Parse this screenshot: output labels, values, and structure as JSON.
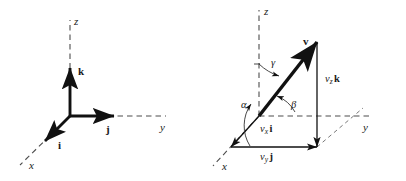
{
  "figure": {
    "background_color": "#ffffff",
    "ink_color": "#111111",
    "dashed_color": "#555555",
    "width": 406,
    "height": 181
  },
  "panels": [
    {
      "id": "unit-vectors",
      "name": "Unit vectors i, j, k on coordinate axes",
      "axes": [
        {
          "name": "x",
          "label": "x",
          "style": "dashed",
          "direction": "down-left"
        },
        {
          "name": "y",
          "label": "y",
          "style": "dashed",
          "direction": "right"
        },
        {
          "name": "z",
          "label": "z",
          "style": "dashed",
          "direction": "up"
        }
      ],
      "vectors": [
        {
          "name": "i",
          "label": "i",
          "bold": true,
          "along_axis": "x",
          "style": "solid-arrow"
        },
        {
          "name": "j",
          "label": "j",
          "bold": true,
          "along_axis": "y",
          "style": "solid-arrow"
        },
        {
          "name": "k",
          "label": "k",
          "bold": true,
          "along_axis": "z",
          "style": "solid-arrow"
        }
      ]
    },
    {
      "id": "components",
      "name": "Vector v resolved into components with direction angles alpha, beta, gamma",
      "axes": [
        {
          "name": "x",
          "label": "x",
          "style": "dashed",
          "direction": "down-left"
        },
        {
          "name": "y",
          "label": "y",
          "style": "dashed",
          "direction": "right"
        },
        {
          "name": "z",
          "label": "z",
          "style": "dashed",
          "direction": "up"
        }
      ],
      "vectors": [
        {
          "name": "v",
          "label": "v",
          "bold": true,
          "style": "thick-solid-arrow"
        }
      ],
      "components": [
        {
          "name": "vx-i",
          "scalar": "v",
          "subscript": "x",
          "unit": "i"
        },
        {
          "name": "vy-j",
          "scalar": "v",
          "subscript": "y",
          "unit": "j"
        },
        {
          "name": "vz-k",
          "scalar": "v",
          "subscript": "z",
          "unit": "k"
        }
      ],
      "angles": [
        {
          "name": "alpha",
          "label": "α",
          "between": "v and x-axis"
        },
        {
          "name": "beta",
          "label": "β",
          "between": "v and y-axis"
        },
        {
          "name": "gamma",
          "label": "γ",
          "between": "v and z-axis"
        }
      ]
    }
  ],
  "labels": {
    "left": {
      "axis_x": "x",
      "axis_y": "y",
      "axis_z": "z",
      "unit_i": "i",
      "unit_j": "j",
      "unit_k": "k"
    },
    "right": {
      "axis_x": "x",
      "axis_y": "y",
      "axis_z": "z",
      "vector_v": "v",
      "angle_alpha": "α",
      "angle_beta": "β",
      "angle_gamma": "γ",
      "comp_x_scalar": "v",
      "comp_x_sub": "x",
      "comp_x_unit": "i",
      "comp_y_scalar": "v",
      "comp_y_sub": "y",
      "comp_y_unit": "j",
      "comp_z_scalar": "v",
      "comp_z_sub": "z",
      "comp_z_unit": "k"
    }
  }
}
